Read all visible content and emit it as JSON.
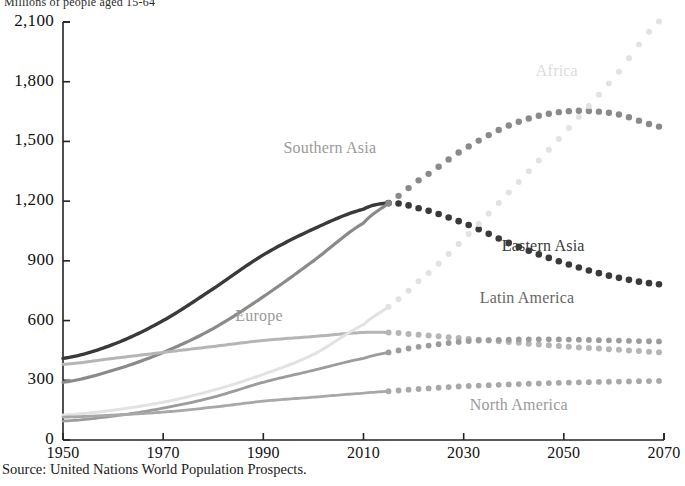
{
  "title": "Millions of people aged 15-64",
  "source_note": "Source: United Nations World Population Prospects.",
  "axes": {
    "y_ticks": [
      "2,100",
      "1,800",
      "1,500",
      "1,200",
      "900",
      "600",
      "300",
      "0"
    ],
    "x_ticks": [
      "1950",
      "1970",
      "1990",
      "2010",
      "2030",
      "2050",
      "2070"
    ]
  },
  "labels": {
    "africa": "Africa",
    "southern_asia": "Southern Asia",
    "eastern_asia": "Eastern Asia",
    "latin_america": "Latin America",
    "north_america": "North America",
    "europe": "Europe"
  },
  "colors": {
    "eastern_asia": "#3a3a3a",
    "southern_asia": "#8a8a8a",
    "europe": "#b5b5b5",
    "africa": "#e2e2e2",
    "latin_america": "#9c9c9c",
    "north_america": "#a8a8a8",
    "axis": "#222222",
    "background": "#ffffff"
  },
  "chart_data": {
    "type": "line",
    "title": "Millions of people aged 15-64",
    "xlabel": "",
    "ylabel": "Millions of people aged 15-64",
    "xlim": [
      1950,
      2070
    ],
    "ylim": [
      0,
      2100
    ],
    "grid": false,
    "legend": "inline-annotations",
    "historical_range": [
      1950,
      2015
    ],
    "projection_range": [
      2015,
      2070
    ],
    "projection_style": "dotted",
    "x": [
      1950,
      1960,
      1970,
      1980,
      1990,
      2000,
      2010,
      2015,
      2020,
      2030,
      2040,
      2050,
      2060,
      2070
    ],
    "series": [
      {
        "name": "Eastern Asia",
        "color": "#3a3a3a",
        "values": [
          410,
          480,
          600,
          760,
          930,
          1060,
          1160,
          1190,
          1170,
          1090,
          980,
          890,
          820,
          780
        ]
      },
      {
        "name": "Southern Asia",
        "color": "#8a8a8a",
        "values": [
          290,
          350,
          440,
          560,
          720,
          900,
          1090,
          1190,
          1290,
          1460,
          1590,
          1650,
          1640,
          1570
        ]
      },
      {
        "name": "Europe",
        "color": "#b5b5b5",
        "values": [
          380,
          410,
          440,
          470,
          500,
          520,
          540,
          540,
          530,
          510,
          490,
          470,
          455,
          440
        ]
      },
      {
        "name": "Africa",
        "color": "#e2e2e2",
        "values": [
          125,
          150,
          190,
          250,
          330,
          430,
          580,
          670,
          780,
          1010,
          1270,
          1540,
          1820,
          2120
        ]
      },
      {
        "name": "Latin America",
        "color": "#9c9c9c",
        "values": [
          95,
          120,
          160,
          215,
          290,
          350,
          410,
          440,
          465,
          495,
          505,
          505,
          500,
          495
        ]
      },
      {
        "name": "North America",
        "color": "#a8a8a8",
        "values": [
          115,
          125,
          140,
          165,
          195,
          215,
          235,
          245,
          255,
          270,
          280,
          288,
          293,
          297
        ]
      }
    ]
  }
}
